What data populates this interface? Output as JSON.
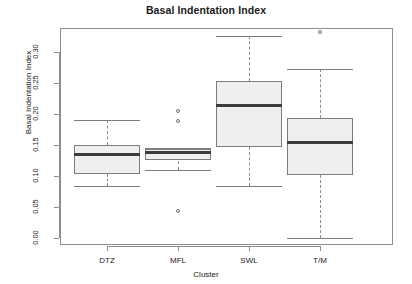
{
  "chart_data": {
    "type": "box",
    "title": "Basal Indentation Index",
    "xlabel": "Cluster",
    "ylabel": "Basal Indentation Index",
    "categories": [
      "DTZ",
      "MFL",
      "SWL",
      "T/M"
    ],
    "ytick_labels": [
      "0.00",
      "0.05",
      "0.10",
      "0.15",
      "0.20",
      "0.25",
      "0.30"
    ],
    "ytick_values": [
      0.0,
      0.05,
      0.1,
      0.15,
      0.2,
      0.25,
      0.3
    ],
    "ylim": [
      -0.012,
      0.345
    ],
    "grid": false,
    "legend": null,
    "box_fill_color": "#efefef",
    "box_border_color": "#7d7d7d",
    "median_color": "#3c3c3c",
    "whisker_color": "#8e8e8e",
    "boxes": [
      {
        "category": "DTZ",
        "whisker_low": 0.084,
        "q1": 0.104,
        "median": 0.134,
        "q3": 0.15,
        "whisker_high": 0.19,
        "outliers": []
      },
      {
        "category": "MFL",
        "whisker_low": 0.11,
        "q1": 0.125,
        "median": 0.138,
        "q3": 0.144,
        "whisker_high": 0.145,
        "outliers": [
          0.205,
          0.188,
          0.043
        ]
      },
      {
        "category": "SWL",
        "whisker_low": 0.084,
        "q1": 0.147,
        "median": 0.214,
        "q3": 0.254,
        "whisker_high": 0.326,
        "outliers": []
      },
      {
        "category": "T/M",
        "whisker_low": 0.0,
        "q1": 0.101,
        "median": 0.154,
        "q3": 0.194,
        "whisker_high": 0.273,
        "outliers": [
          0.333
        ]
      }
    ]
  },
  "layout": {
    "plot_left": 60,
    "plot_top": 28,
    "plot_width": 333,
    "plot_height": 217,
    "y_pixel_at_zero": 238,
    "y_pixel_per_unit": 620,
    "box_centers": [
      107,
      178,
      249,
      320
    ],
    "box_half_width": 33,
    "mfl_half_width": 33
  }
}
